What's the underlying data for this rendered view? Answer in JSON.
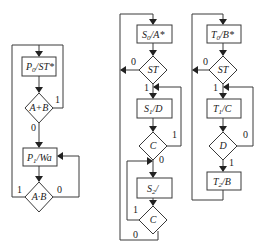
{
  "diagram": {
    "type": "ASM flowcharts",
    "charts": [
      {
        "id": "left",
        "states": [
          {
            "label": "P0/ST*",
            "main": "P",
            "sub": "0",
            "rest": "/ST*"
          },
          {
            "label": "P1/Wa",
            "main": "P",
            "sub": "1",
            "rest": "/Wa"
          }
        ],
        "decisions": [
          {
            "label": "A+B",
            "true_label": "1",
            "false_label": "0"
          },
          {
            "label": "A·B",
            "true_label": "1",
            "false_label": "0"
          }
        ]
      },
      {
        "id": "middle",
        "states": [
          {
            "label": "S0/A*",
            "main": "S",
            "sub": "0",
            "rest": "/A*"
          },
          {
            "label": "S1/D",
            "main": "S",
            "sub": "1",
            "rest": "/D"
          },
          {
            "label": "S2/",
            "main": "S",
            "sub": "2",
            "rest": "/"
          }
        ],
        "decisions": [
          {
            "label": "ST",
            "true_label": "1",
            "false_label": "0"
          },
          {
            "label": "C",
            "true_label": "1",
            "false_label": "0"
          },
          {
            "label": "C",
            "true_label": "1",
            "false_label": "0"
          }
        ]
      },
      {
        "id": "right",
        "states": [
          {
            "label": "T0/B*",
            "main": "T",
            "sub": "0",
            "rest": "/B*"
          },
          {
            "label": "T1/C",
            "main": "T",
            "sub": "1",
            "rest": "/C"
          },
          {
            "label": "T2/B",
            "main": "T",
            "sub": "2",
            "rest": "/B"
          }
        ],
        "decisions": [
          {
            "label": "ST",
            "true_label": "1",
            "false_label": "0"
          },
          {
            "label": "D",
            "true_label": "1",
            "false_label": "0"
          }
        ]
      }
    ]
  }
}
